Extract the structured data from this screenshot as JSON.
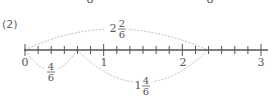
{
  "top_fragments": [
    "8",
    "8"
  ],
  "problem": {
    "label": "(2)",
    "number_line": {
      "min": 0,
      "max": 3,
      "subdivisions_per_unit": 6,
      "tick_labels": [
        "0",
        "1",
        "2",
        "3"
      ]
    },
    "arcs": [
      {
        "from": "0",
        "to": "2 2/6",
        "position": "above",
        "whole": "2",
        "numerator": "2",
        "denominator": "6"
      },
      {
        "from": "0",
        "to": "4/6",
        "position": "below",
        "whole": "",
        "numerator": "4",
        "denominator": "6"
      },
      {
        "from": "4/6",
        "to": "2 2/6",
        "position": "below",
        "whole": "1",
        "numerator": "4",
        "denominator": "6"
      }
    ]
  },
  "colors": {
    "axis": "#555555",
    "arc": "#aaaaaa",
    "text": "#555555"
  }
}
